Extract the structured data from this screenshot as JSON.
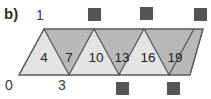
{
  "figure": {
    "panel_label": "b)",
    "type": "triangle-strip",
    "vertex_labels": {
      "top_left": "1",
      "bottom_left": "0",
      "bottom_mid": "3"
    },
    "triangles": [
      {
        "label": "4",
        "orientation": "up",
        "fill": "#e3e3e3"
      },
      {
        "label": "7",
        "orientation": "down",
        "fill": "#b8b8b8"
      },
      {
        "label": "10",
        "orientation": "up",
        "fill": "#e3e3e3"
      },
      {
        "label": "13",
        "orientation": "down",
        "fill": "#b8b8b8"
      },
      {
        "label": "16",
        "orientation": "up",
        "fill": "#e3e3e3"
      },
      {
        "label": "19",
        "orientation": "down",
        "fill": "#b8b8b8"
      }
    ],
    "markers": {
      "shape": "square",
      "color": "#555555",
      "top_row_count": 3,
      "bottom_row_count": 2
    },
    "colors": {
      "light_fill": "#e3e3e3",
      "dark_fill": "#b8b8b8",
      "outline": "#5a5a5a",
      "marker": "#555555",
      "text": "#2e2e2e",
      "background": "#ffffff"
    }
  }
}
